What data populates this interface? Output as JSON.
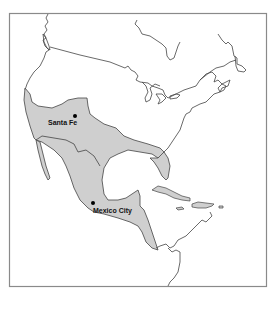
{
  "map": {
    "title": "",
    "region_fill": "#cfcfcf",
    "outline_color": "#444444",
    "frame_color": "#8a8a8a",
    "cities": [
      {
        "name": "Santa Fe",
        "dot": [
          75,
          116
        ],
        "label": [
          48,
          124
        ]
      },
      {
        "name": "Mexico City",
        "dot": [
          93,
          203
        ],
        "label": [
          93,
          213
        ]
      }
    ]
  }
}
